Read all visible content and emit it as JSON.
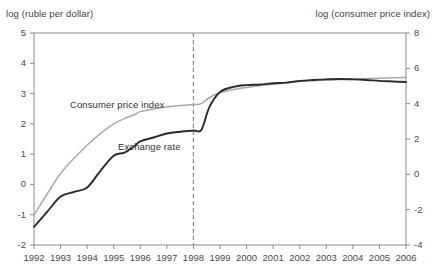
{
  "axis_captions": {
    "left": "log (ruble per dollar)",
    "right": "log (consumer price index)"
  },
  "series_labels": {
    "cpi": "Consumer price index",
    "exchange": "Exchange rate"
  },
  "colors": {
    "cpi_line": "#a9a9a9",
    "exchange_line": "#2b2b2b",
    "axis": "#8a8a8a",
    "event_line": "#8a8a8a",
    "background": "#ffffff",
    "text": "#3f3f3f"
  },
  "chart_data": {
    "type": "line",
    "title": "",
    "subtitle": "",
    "xlabel": "",
    "ylabel": "log (ruble per dollar)",
    "y2label": "log (consumer price index)",
    "grid": false,
    "legend": "inline-labels",
    "xlim": [
      1992,
      2006
    ],
    "ylim": [
      -2,
      5
    ],
    "y2lim": [
      -4,
      8
    ],
    "xticks": [
      "1992",
      "1993",
      "1994",
      "1995",
      "1996",
      "1997",
      "1998",
      "1999",
      "2000",
      "2001",
      "2002",
      "2003",
      "2004",
      "2005",
      "2006"
    ],
    "yticks": [
      "5",
      "4",
      "3",
      "2",
      "1",
      "0",
      "-1",
      "-2"
    ],
    "y2ticks": [
      "8",
      "6",
      "4",
      "2",
      "0",
      "-2",
      "-4"
    ],
    "annotations": [
      {
        "name": "crisis-marker",
        "type": "vline",
        "x": 1998,
        "style": "dashed",
        "label": ""
      }
    ],
    "x": [
      1992,
      1992.5,
      1993,
      1993.5,
      1994,
      1994.5,
      1995,
      1995.4,
      1995.8,
      1996,
      1996.5,
      1997,
      1997.5,
      1998,
      1998.3,
      1998.6,
      1999,
      1999.5,
      2000,
      2000.5,
      2001,
      2001.5,
      2002,
      2002.5,
      2003,
      2003.5,
      2004,
      2004.5,
      2005,
      2005.5,
      2006
    ],
    "series": [
      {
        "name": "Exchange rate",
        "axis": "left",
        "color": "#2b2b2b",
        "values": [
          -1.4,
          -0.9,
          -0.4,
          -0.25,
          -0.1,
          0.45,
          0.95,
          1.05,
          1.28,
          1.42,
          1.55,
          1.68,
          1.74,
          1.78,
          1.8,
          2.55,
          3.05,
          3.22,
          3.28,
          3.3,
          3.34,
          3.36,
          3.42,
          3.45,
          3.47,
          3.48,
          3.47,
          3.45,
          3.42,
          3.4,
          3.38
        ]
      },
      {
        "name": "Consumer price index",
        "axis": "right",
        "color": "#a9a9a9",
        "values": [
          -2.3,
          -1.1,
          0.05,
          0.9,
          1.65,
          2.3,
          2.85,
          3.15,
          3.4,
          3.55,
          3.7,
          3.82,
          3.9,
          3.95,
          4.0,
          4.35,
          4.62,
          4.8,
          4.92,
          5.02,
          5.1,
          5.18,
          5.25,
          5.3,
          5.34,
          5.37,
          5.4,
          5.42,
          5.44,
          5.46,
          5.48
        ]
      }
    ]
  }
}
